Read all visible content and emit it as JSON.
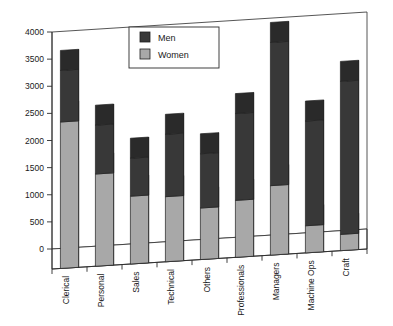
{
  "chart_data": {
    "type": "bar",
    "subtype": "stacked-3d-column",
    "title": "",
    "subtitle": "",
    "xlabel": "",
    "ylabel": "",
    "ylim": [
      0,
      4000
    ],
    "ytick_step": 500,
    "yticks": [
      0,
      500,
      1000,
      1500,
      2000,
      2500,
      3000,
      3500,
      4000
    ],
    "ytick_labels": [
      "0",
      "500",
      "1000",
      "1500",
      "2000",
      "2500",
      "3000",
      "3500",
      "4000"
    ],
    "grid": false,
    "legend_position": "top-center",
    "categories": [
      "Clerical",
      "Personal",
      "Sales",
      "Technical",
      "Others",
      "Professionals",
      "Managers",
      "Machine Ops",
      "Craft"
    ],
    "series": [
      {
        "name": "Women",
        "color": "#a8a8a8",
        "values": [
          2700,
          1700,
          1250,
          1200,
          950,
          1050,
          1280,
          500,
          300
        ]
      },
      {
        "name": "Men",
        "color": "#383838",
        "values": [
          950,
          900,
          700,
          1150,
          1000,
          1600,
          2640,
          1930,
          2820
        ]
      }
    ],
    "totals": [
      3650,
      2600,
      1950,
      2350,
      1950,
      2650,
      3920,
      2430,
      3120
    ]
  },
  "legend": {
    "entries": [
      {
        "label": "Men",
        "color": "#383838"
      },
      {
        "label": "Women",
        "color": "#a8a8a8"
      }
    ]
  },
  "colors": {
    "men_front": "#383838",
    "men_top": "#2a2a2a",
    "men_side": "#4a4a4a",
    "women_front": "#a8a8a8",
    "women_top": "#9a9a9a",
    "women_side": "#bcbcbc",
    "axis": "#2b2b2b",
    "background": "#ffffff",
    "floor": "#ffffff",
    "wall": "#ffffff"
  }
}
